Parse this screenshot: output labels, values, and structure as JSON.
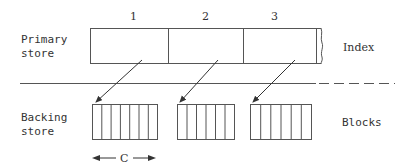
{
  "diagram": {
    "primary_label_line1": "Primary",
    "primary_label_line2": "store",
    "backing_label_line1": "Backing",
    "backing_label_line2": "store",
    "index_label": "Index",
    "blocks_label": "Blocks",
    "dimension_label": "C",
    "index_cells": [
      {
        "number": "1"
      },
      {
        "number": "2"
      },
      {
        "number": "3"
      }
    ],
    "blocks": [
      {
        "cells": 7
      },
      {
        "cells": 6
      },
      {
        "cells": 6
      }
    ],
    "colors": {
      "stroke": "#555555",
      "text": "#333333",
      "background": "#ffffff"
    }
  }
}
